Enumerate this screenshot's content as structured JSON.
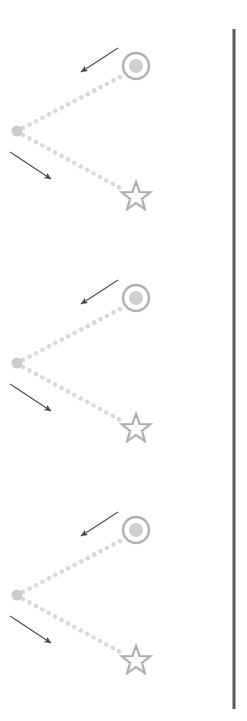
{
  "canvas": {
    "width": 247,
    "height": 721,
    "background": "#ffffff"
  },
  "colors": {
    "dotted_connector": "#d9d9d9",
    "marker_outline": "#b0b0b0",
    "marker_fill": "#cfcfcf",
    "vertex_dot": "#cbcbcb",
    "arrow": "#4a4a4a",
    "divider_line": "#5a5a5a"
  },
  "divider": {
    "name": "vertical-divider-line",
    "x": 234,
    "y_top": 29,
    "y_bottom": 709,
    "thickness": 3,
    "color": "#5a5a5a"
  },
  "groups": [
    {
      "id": "group-1",
      "label": "Group 1",
      "offset_y": 0,
      "vertex_dot": {
        "cx": 17,
        "cy": 131,
        "r": 5.5
      },
      "circle_marker": {
        "cx": 136,
        "cy": 66,
        "r_outer": 13,
        "r_inner": 7
      },
      "star_marker": {
        "cx": 136,
        "cy": 197,
        "r_outer": 15,
        "r_inner": 6.2
      },
      "connector_upper": {
        "x1": 23,
        "y1": 128,
        "x2": 122,
        "y2": 76
      },
      "connector_lower": {
        "x1": 23,
        "y1": 135,
        "x2": 124,
        "y2": 190
      },
      "arrow_upper": {
        "x1": 118,
        "y1": 48,
        "x2": 81,
        "y2": 72,
        "direction": "down-left"
      },
      "arrow_lower": {
        "x1": 10,
        "y1": 152,
        "x2": 51,
        "y2": 179,
        "direction": "down-right"
      }
    },
    {
      "id": "group-2",
      "label": "Group 2",
      "offset_y": 232,
      "vertex_dot": {
        "cx": 17,
        "cy": 363,
        "r": 5.5
      },
      "circle_marker": {
        "cx": 136,
        "cy": 298,
        "r_outer": 13,
        "r_inner": 7
      },
      "star_marker": {
        "cx": 136,
        "cy": 429,
        "r_outer": 15,
        "r_inner": 6.2
      },
      "connector_upper": {
        "x1": 23,
        "y1": 360,
        "x2": 122,
        "y2": 308
      },
      "connector_lower": {
        "x1": 23,
        "y1": 367,
        "x2": 124,
        "y2": 422
      },
      "arrow_upper": {
        "x1": 118,
        "y1": 280,
        "x2": 81,
        "y2": 304,
        "direction": "down-left"
      },
      "arrow_lower": {
        "x1": 10,
        "y1": 384,
        "x2": 51,
        "y2": 411,
        "direction": "down-right"
      }
    },
    {
      "id": "group-3",
      "label": "Group 3",
      "offset_y": 464,
      "vertex_dot": {
        "cx": 17,
        "cy": 595,
        "r": 5.5
      },
      "circle_marker": {
        "cx": 136,
        "cy": 530,
        "r_outer": 13,
        "r_inner": 7
      },
      "star_marker": {
        "cx": 136,
        "cy": 661,
        "r_outer": 15,
        "r_inner": 6.2
      },
      "connector_upper": {
        "x1": 23,
        "y1": 592,
        "x2": 122,
        "y2": 540
      },
      "connector_lower": {
        "x1": 23,
        "y1": 599,
        "x2": 124,
        "y2": 654
      },
      "arrow_upper": {
        "x1": 118,
        "y1": 512,
        "x2": 81,
        "y2": 536,
        "direction": "down-left"
      },
      "arrow_lower": {
        "x1": 10,
        "y1": 616,
        "x2": 51,
        "y2": 643,
        "direction": "down-right"
      }
    }
  ]
}
